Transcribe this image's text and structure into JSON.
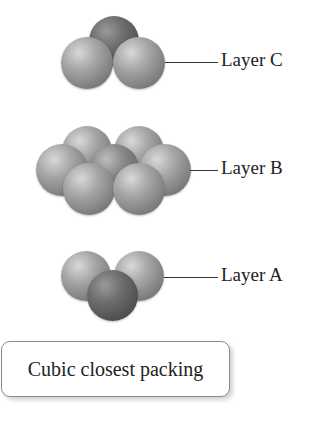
{
  "figure": {
    "layers": [
      {
        "id": "C",
        "label": "Layer C",
        "sphere_count": 3
      },
      {
        "id": "B",
        "label": "Layer B",
        "sphere_count": 7
      },
      {
        "id": "A",
        "label": "Layer A",
        "sphere_count": 3
      }
    ],
    "caption": "Cubic closest packing",
    "colors": {
      "sphere_light": "#a6a6a6",
      "sphere_dark": "#5c5c5c",
      "leader_line": "#333333",
      "caption_border": "#8a8a8a"
    }
  }
}
